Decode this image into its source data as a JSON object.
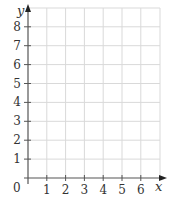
{
  "chart_data": {
    "type": "scatter",
    "title": "",
    "xlabel": "x",
    "ylabel": "y",
    "origin_label": "0",
    "x": [],
    "y": [],
    "series": [],
    "x_ticks": [
      1,
      2,
      3,
      4,
      5,
      6
    ],
    "y_ticks": [
      1,
      2,
      3,
      4,
      5,
      6,
      7,
      8
    ],
    "xlim": [
      0,
      7
    ],
    "ylim": [
      0,
      8.5
    ],
    "grid": true,
    "legend": null
  },
  "colors": {
    "axis": "#555555",
    "grid": "#d9d9d9",
    "text": "#333333"
  }
}
